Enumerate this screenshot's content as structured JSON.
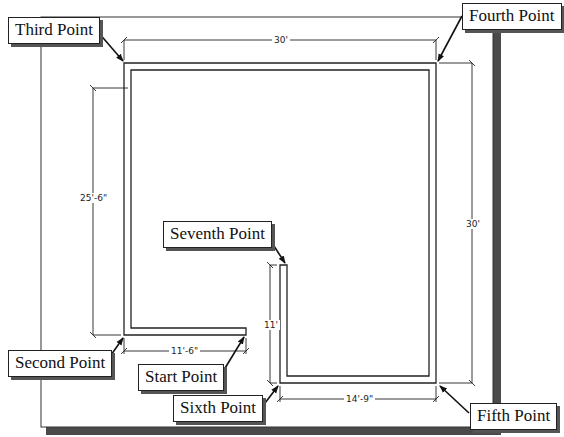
{
  "drawing": {
    "type": "floor-plan-outline",
    "description": "L-shaped room wall outline with dimensions and point callouts",
    "colors": {
      "paper": "#ffffff",
      "line": "#222222",
      "shadow": "#4a4a4a"
    },
    "callouts": {
      "third": "Third Point",
      "fourth": "Fourth Point",
      "seventh": "Seventh Point",
      "second": "Second Point",
      "start": "Start Point",
      "sixth": "Sixth Point",
      "fifth": "Fifth Point"
    },
    "dimensions": {
      "top": "30'",
      "left": "25'-6\"",
      "right": "30'",
      "bottom_left": "11'-6\"",
      "notch_vertical": "11'",
      "bottom_right": "14'-9\""
    }
  }
}
